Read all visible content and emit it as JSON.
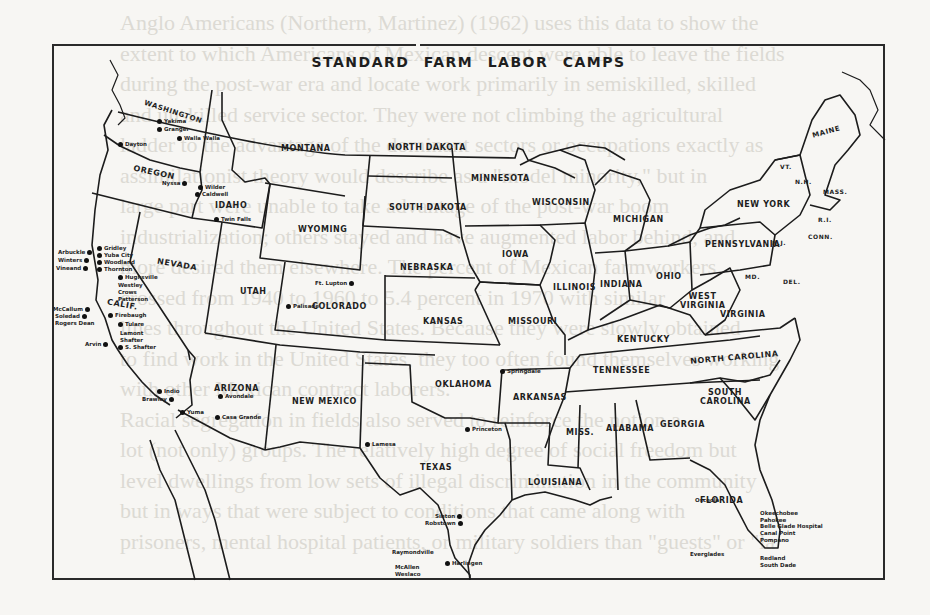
{
  "figure": {
    "title": "STANDARD FARM LABOR CAMPS",
    "background_text_lines": [
      "Anglo Americans (Northern, Martinez) (1962) uses this data to show the",
      "extent to which Americans of Mexican descent were able to leave the fields",
      "during the post-war era and locate work primarily in semiskilled, skilled",
      "and unskilled service sector. They were not climbing the agricultural",
      "ladder to the advantage of the dominant sectors or occupations exactly as",
      "assimilationist theory would describe as a \"model minority,\" but in",
      "large part were unable to take advantage of the post-war boom",
      "industrialization; others stayed and have augmented labor behind, and",
      "more desired them elsewhere. The percent of Mexican farmworkers",
      "crossed from 1940 to 1960 to 5.4 percent in 1970 with similar",
      "lines throughout the United States. Because they were slowly obtained",
      "to find work in the United States, they too often found themselves working",
      "with other Mexican contract laborers.",
      "Racial segregation in fields also served to reinforce the notion a",
      "lot (not only) groups. The relatively high degree of social freedom but",
      "level dwellings from low sets of illegal discrimination in the community",
      "but in ways that were subject to conditions that came along with",
      "prisoners, mental hospital patients, or military soldiers than \"guests\" or \"la"
    ],
    "states": [
      {
        "name": "WASHINGTON"
      },
      {
        "name": "OREGON"
      },
      {
        "name": "IDAHO"
      },
      {
        "name": "MONTANA"
      },
      {
        "name": "WYOMING"
      },
      {
        "name": "NEVADA"
      },
      {
        "name": "CALIF."
      },
      {
        "name": "UTAH"
      },
      {
        "name": "COLORADO"
      },
      {
        "name": "ARIZONA"
      },
      {
        "name": "NEW MEXICO"
      },
      {
        "name": "NORTH DAKOTA"
      },
      {
        "name": "SOUTH DAKOTA"
      },
      {
        "name": "NEBRASKA"
      },
      {
        "name": "KANSAS"
      },
      {
        "name": "OKLAHOMA"
      },
      {
        "name": "TEXAS"
      },
      {
        "name": "MINNESOTA"
      },
      {
        "name": "IOWA"
      },
      {
        "name": "MISSOURI"
      },
      {
        "name": "ARKANSAS"
      },
      {
        "name": "LOUISIANA"
      },
      {
        "name": "WISCONSIN"
      },
      {
        "name": "ILLINOIS"
      },
      {
        "name": "MICHIGAN"
      },
      {
        "name": "INDIANA"
      },
      {
        "name": "OHIO"
      },
      {
        "name": "KENTUCKY"
      },
      {
        "name": "TENNESSEE"
      },
      {
        "name": "MISS."
      },
      {
        "name": "ALABAMA"
      },
      {
        "name": "GEORGIA"
      },
      {
        "name": "FLORIDA"
      },
      {
        "name": "SOUTH CAROLINA"
      },
      {
        "name": "NORTH CAROLINA"
      },
      {
        "name": "VIRGINIA"
      },
      {
        "name": "WEST VIRGINIA"
      },
      {
        "name": "PENNSYLVANIA"
      },
      {
        "name": "NEW YORK"
      },
      {
        "name": "MAINE"
      },
      {
        "name": "VT."
      },
      {
        "name": "N.H."
      },
      {
        "name": "MASS."
      },
      {
        "name": "R.I."
      },
      {
        "name": "CONN."
      },
      {
        "name": "N.J."
      },
      {
        "name": "MD."
      },
      {
        "name": "DEL."
      }
    ],
    "camps": [
      {
        "name": "Yakima"
      },
      {
        "name": "Granger"
      },
      {
        "name": "Walla Walla"
      },
      {
        "name": "Dayton"
      },
      {
        "name": "Nyssa"
      },
      {
        "name": "Wilder"
      },
      {
        "name": "Caldwell"
      },
      {
        "name": "Twin Falls"
      },
      {
        "name": "Gridley"
      },
      {
        "name": "Yuba City"
      },
      {
        "name": "Arbuckle"
      },
      {
        "name": "Woodland"
      },
      {
        "name": "Winters"
      },
      {
        "name": "Thornton"
      },
      {
        "name": "Vineand"
      },
      {
        "name": "Hughsville"
      },
      {
        "name": "Westley"
      },
      {
        "name": "Crows"
      },
      {
        "name": "Patterson"
      },
      {
        "name": "McCallum"
      },
      {
        "name": "Soledad"
      },
      {
        "name": "Firebaugh"
      },
      {
        "name": "Rogers Dean"
      },
      {
        "name": "Tulare"
      },
      {
        "name": "Lamont"
      },
      {
        "name": "Shafter"
      },
      {
        "name": "Arvin"
      },
      {
        "name": "S. Shafter"
      },
      {
        "name": "Indio"
      },
      {
        "name": "Brawley"
      },
      {
        "name": "Yuma"
      },
      {
        "name": "Avondale"
      },
      {
        "name": "Casa Grande"
      },
      {
        "name": "Ft. Lupton"
      },
      {
        "name": "Palisade"
      },
      {
        "name": "Lamesa"
      },
      {
        "name": "Princeton"
      },
      {
        "name": "Springdale"
      },
      {
        "name": "Sinton"
      },
      {
        "name": "Robstown"
      },
      {
        "name": "Raymondville"
      },
      {
        "name": "McAllen"
      },
      {
        "name": "Weslaco"
      },
      {
        "name": "Harlingen"
      },
      {
        "name": "Osceola"
      },
      {
        "name": "Okeechobee"
      },
      {
        "name": "Pahokee"
      },
      {
        "name": "Belle Glade Hospital"
      },
      {
        "name": "Canal Point"
      },
      {
        "name": "Pompano"
      },
      {
        "name": "Everglades"
      },
      {
        "name": "Redland"
      },
      {
        "name": "South Dade"
      }
    ]
  }
}
